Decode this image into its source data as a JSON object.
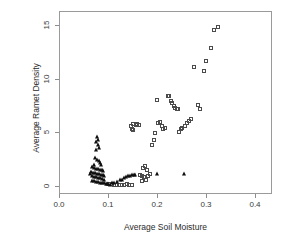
{
  "chart_data": {
    "type": "scatter",
    "title": "",
    "xlabel": "Average Soil Moisture",
    "ylabel": "Average Ramet Density",
    "xlim": [
      0.0,
      0.42
    ],
    "ylim": [
      -0.4,
      15.8
    ],
    "xticks": [
      0.0,
      0.1,
      0.2,
      0.3,
      0.4
    ],
    "xticklabels": [
      "0.0",
      "0.1",
      "0.2",
      "0.3",
      "0.4"
    ],
    "yticks": [
      0,
      5,
      10,
      15
    ],
    "yticklabels": [
      "0",
      "5",
      "10",
      "15"
    ],
    "grid": false,
    "legend": false,
    "marker_colors": {
      "square": "#4b4b4b",
      "triangle": "#0d0d0d"
    },
    "series": [
      {
        "name": "open-square",
        "marker": "square",
        "filled": false,
        "points": [
          [
            0.148,
            5.3
          ],
          [
            0.152,
            5.75
          ],
          [
            0.157,
            5.7
          ],
          [
            0.16,
            5.78
          ],
          [
            0.163,
            5.72
          ],
          [
            0.15,
            5.25
          ],
          [
            0.146,
            5.6
          ],
          [
            0.172,
            1.7
          ],
          [
            0.176,
            1.85
          ],
          [
            0.18,
            1.5
          ],
          [
            0.166,
            1.05
          ],
          [
            0.17,
            0.95
          ],
          [
            0.174,
            0.8
          ],
          [
            0.178,
            0.6
          ],
          [
            0.169,
            0.45
          ],
          [
            0.182,
            0.95
          ],
          [
            0.186,
            1.1
          ],
          [
            0.19,
            3.85
          ],
          [
            0.193,
            4.3
          ],
          [
            0.196,
            4.95
          ],
          [
            0.199,
            8.0
          ],
          [
            0.203,
            5.9
          ],
          [
            0.206,
            5.95
          ],
          [
            0.21,
            5.55
          ],
          [
            0.213,
            5.3
          ],
          [
            0.216,
            5.4
          ],
          [
            0.222,
            8.4
          ],
          [
            0.225,
            8.35
          ],
          [
            0.228,
            7.95
          ],
          [
            0.231,
            7.7
          ],
          [
            0.234,
            7.45
          ],
          [
            0.237,
            7.25
          ],
          [
            0.24,
            7.2
          ],
          [
            0.243,
            7.2
          ],
          [
            0.245,
            5.05
          ],
          [
            0.248,
            5.35
          ],
          [
            0.252,
            5.45
          ],
          [
            0.258,
            5.6
          ],
          [
            0.262,
            5.85
          ],
          [
            0.266,
            6.05
          ],
          [
            0.27,
            6.25
          ],
          [
            0.276,
            11.1
          ],
          [
            0.283,
            7.55
          ],
          [
            0.288,
            7.2
          ],
          [
            0.295,
            10.7
          ],
          [
            0.3,
            11.6
          ],
          [
            0.31,
            12.9
          ],
          [
            0.316,
            14.5
          ],
          [
            0.325,
            14.8
          ],
          [
            0.113,
            0.12
          ],
          [
            0.118,
            0.1
          ],
          [
            0.123,
            0.08
          ],
          [
            0.128,
            0.12
          ],
          [
            0.133,
            0.1
          ],
          [
            0.138,
            0.14
          ],
          [
            0.143,
            0.12
          ],
          [
            0.148,
            0.1
          ],
          [
            0.108,
            0.15
          ],
          [
            0.103,
            0.18
          ]
        ]
      },
      {
        "name": "filled-triangle",
        "marker": "triangle",
        "filled": true,
        "points": [
          [
            0.077,
            4.55
          ],
          [
            0.08,
            4.25
          ],
          [
            0.075,
            4.1
          ],
          [
            0.079,
            3.8
          ],
          [
            0.082,
            3.55
          ],
          [
            0.076,
            3.35
          ],
          [
            0.074,
            2.6
          ],
          [
            0.078,
            2.45
          ],
          [
            0.081,
            2.3
          ],
          [
            0.084,
            2.15
          ],
          [
            0.072,
            2.0
          ],
          [
            0.086,
            1.95
          ],
          [
            0.068,
            1.75
          ],
          [
            0.071,
            1.65
          ],
          [
            0.075,
            1.6
          ],
          [
            0.079,
            1.55
          ],
          [
            0.083,
            1.5
          ],
          [
            0.087,
            1.45
          ],
          [
            0.09,
            1.4
          ],
          [
            0.066,
            1.3
          ],
          [
            0.07,
            1.25
          ],
          [
            0.073,
            1.2
          ],
          [
            0.077,
            1.15
          ],
          [
            0.081,
            1.1
          ],
          [
            0.085,
            1.05
          ],
          [
            0.089,
            1.0
          ],
          [
            0.092,
            0.95
          ],
          [
            0.064,
            1.1
          ],
          [
            0.068,
            0.9
          ],
          [
            0.072,
            0.85
          ],
          [
            0.076,
            0.8
          ],
          [
            0.08,
            0.75
          ],
          [
            0.084,
            0.7
          ],
          [
            0.088,
            0.65
          ],
          [
            0.091,
            0.6
          ],
          [
            0.067,
            0.5
          ],
          [
            0.071,
            0.45
          ],
          [
            0.075,
            0.4
          ],
          [
            0.079,
            0.35
          ],
          [
            0.083,
            0.3
          ],
          [
            0.087,
            0.28
          ],
          [
            0.091,
            0.25
          ],
          [
            0.095,
            0.22
          ],
          [
            0.098,
            0.18
          ],
          [
            0.101,
            0.15
          ],
          [
            0.105,
            0.12
          ],
          [
            0.118,
            0.4
          ],
          [
            0.124,
            0.55
          ],
          [
            0.129,
            0.6
          ],
          [
            0.133,
            0.7
          ],
          [
            0.137,
            0.8
          ],
          [
            0.141,
            0.9
          ],
          [
            0.145,
            0.95
          ],
          [
            0.149,
            1.0
          ],
          [
            0.153,
            1.05
          ],
          [
            0.156,
            1.0
          ],
          [
            0.113,
            0.3
          ],
          [
            0.109,
            0.25
          ],
          [
            0.2,
            1.1
          ],
          [
            0.255,
            1.1
          ]
        ]
      }
    ]
  }
}
